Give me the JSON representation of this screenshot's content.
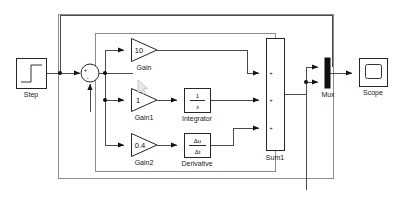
{
  "diagram": {
    "tool": "Simulink",
    "background_color": "#ffffff",
    "wire_color": "#4a4a4a",
    "block_stroke_color": "#262626",
    "frame_color": "#8c8c8c"
  },
  "blocks": {
    "step": {
      "label": "Step",
      "type": "step-source",
      "x": 16,
      "y": 58,
      "w": 30,
      "h": 30
    },
    "sum": {
      "label": "",
      "type": "sum-junction",
      "cx": 90,
      "cy": 73,
      "r": 9,
      "input_signs": [
        "+",
        "-"
      ],
      "plus_sign": "+",
      "minus_sign": "-"
    },
    "gain": {
      "label": "Gain",
      "value": "10",
      "type": "gain-triangle",
      "x": 131,
      "y": 38,
      "w": 26,
      "h": 24
    },
    "gain1": {
      "label": "Gain1",
      "value": "1",
      "type": "gain-triangle",
      "x": 131,
      "y": 88,
      "w": 26,
      "h": 24
    },
    "gain2": {
      "label": "Gain2",
      "value": "0.4",
      "type": "gain-triangle",
      "x": 131,
      "y": 133,
      "w": 26,
      "h": 24
    },
    "integrator": {
      "label": "Integrator",
      "numerator": "1",
      "denominator": "s",
      "type": "transfer-block",
      "x": 184,
      "y": 88,
      "w": 26,
      "h": 24
    },
    "derivative": {
      "label": "Derivative",
      "numerator": "Δu",
      "denominator": "Δt",
      "type": "derivative-block",
      "x": 184,
      "y": 133,
      "w": 26,
      "h": 24
    },
    "sum1": {
      "label": "Sum1",
      "type": "sum-bar",
      "x": 266,
      "y": 38,
      "w": 18,
      "h": 112,
      "input_signs": [
        "+",
        "+",
        "+"
      ]
    },
    "mux": {
      "label": "Mux",
      "type": "mux-bar",
      "x": 325,
      "y": 58,
      "w": 5,
      "h": 30,
      "inputs": 2
    },
    "scope": {
      "label": "Scope",
      "type": "scope-sink",
      "x": 359,
      "y": 58,
      "w": 28,
      "h": 28
    }
  },
  "frames": {
    "outer": {
      "x": 58,
      "y": 14,
      "w": 275,
      "h": 164
    },
    "inner": {
      "x": 95,
      "y": 33,
      "w": 180,
      "h": 138
    }
  },
  "signals": {
    "feedback_top": "output to sum negative input",
    "error_branch": "error split to three gain paths",
    "mux_second": "error signal to mux input 2"
  },
  "cursor": {
    "visible": true,
    "x": 140,
    "y": 84,
    "name": "mouse-pointer"
  }
}
